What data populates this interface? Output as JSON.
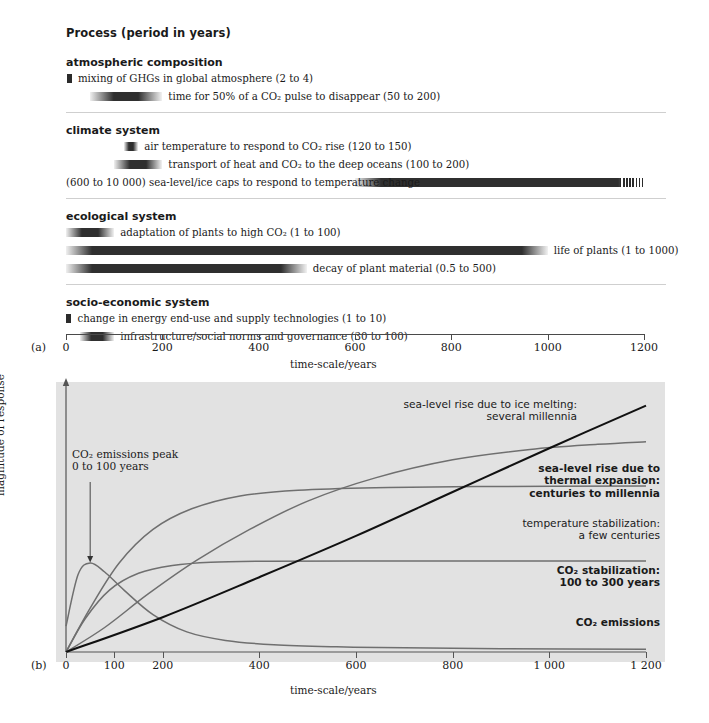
{
  "panel_a": {
    "letter": "(a)",
    "title": "Process (period in years)",
    "axis_label": "time-scale/years",
    "axis_ticks": [
      0,
      200,
      400,
      600,
      800,
      1000,
      1200
    ],
    "axis_tick_labels": [
      "0",
      "200",
      "400",
      "600",
      "800",
      "1000",
      "1200"
    ],
    "axis_min": 0,
    "axis_max": 1200,
    "groups": [
      {
        "heading": "atmospheric composition",
        "rows": [
          {
            "label": "mixing of GHGs in global atmosphere (2 to 4)",
            "range_label": "(2 to 4)",
            "start": 2,
            "end": 4,
            "label_side": "right"
          },
          {
            "label": "time for 50% of a CO₂ pulse to disappear (50 to 200)",
            "range_label": "(50 to 200)",
            "start": 50,
            "end": 200,
            "label_side": "right"
          }
        ]
      },
      {
        "heading": "climate system",
        "rows": [
          {
            "label": "air temperature to respond to CO₂ rise (120 to 150)",
            "range_label": "(120 to 150)",
            "start": 120,
            "end": 150,
            "label_side": "right"
          },
          {
            "label": "transport of heat and CO₂ to the deep oceans (100 to 200)",
            "range_label": "(100 to 200)",
            "start": 100,
            "end": 200,
            "label_side": "right"
          },
          {
            "label": "(600 to 10 000) sea-level/ice caps to respond to temperature change",
            "range_label": "(600 to 10 000)",
            "start": 600,
            "end": 1200,
            "label_side": "left",
            "hatched_tail": true
          }
        ]
      },
      {
        "heading": "ecological system",
        "rows": [
          {
            "label": "adaptation of plants to high CO₂ (1 to 100)",
            "range_label": "(1 to 100)",
            "start": 1,
            "end": 100,
            "label_side": "right"
          },
          {
            "label": "life of plants (1 to 1000)",
            "range_label": "(1 to 1000)",
            "start": 1,
            "end": 1000,
            "label_side": "right"
          },
          {
            "label": "decay of plant material (0.5 to 500)",
            "range_label": "(0.5 to 500)",
            "start": 0.5,
            "end": 500,
            "label_side": "right"
          }
        ]
      },
      {
        "heading": "socio-economic system",
        "rows": [
          {
            "label": "change in energy end-use and supply technologies (1 to 10)",
            "range_label": "(1 to 10)",
            "start": 1,
            "end": 10,
            "label_side": "right"
          },
          {
            "label": "infrastructure/social norms and governance (30 to 100)",
            "range_label": "(30 to 100)",
            "start": 30,
            "end": 100,
            "label_side": "right"
          }
        ]
      }
    ]
  },
  "panel_b": {
    "letter": "(b)",
    "ylabel": "magnitude of response",
    "axis_label": "time-scale/years",
    "axis_ticks": [
      0,
      100,
      200,
      400,
      600,
      800,
      1000,
      1200
    ],
    "axis_tick_labels": [
      "0",
      "100",
      "200",
      "400",
      "600",
      "800",
      "1 000",
      "1 200"
    ],
    "axis_min": 0,
    "axis_max": 1200,
    "annotation_peak": "CO₂ emissions peak\n0 to 100 years",
    "annotation_peak_line1": "CO₂ emissions peak",
    "annotation_peak_line2": "0 to 100 years",
    "curve_labels": [
      {
        "line1": "sea-level rise due to ice melting:",
        "line2": "several millennia",
        "bold": false
      },
      {
        "line1": "sea-level rise due to",
        "line2": "thermal expansion:",
        "line3": "centuries to millennia",
        "bold": true
      },
      {
        "line1": "temperature stabilization:",
        "line2": "a few centuries",
        "bold": false
      },
      {
        "line1": "CO₂ stabilization:",
        "line2": "100 to 300 years",
        "bold": true
      },
      {
        "line1": "CO₂ emissions",
        "bold": true
      }
    ]
  },
  "chart_data": [
    {
      "type": "bar",
      "name": "panel-a-timescale-ranges",
      "title": "Process (period in years)",
      "xlabel": "time-scale/years",
      "ylabel": "",
      "xlim": [
        0,
        1200
      ],
      "grid": false,
      "orientation": "horizontal",
      "categories": [
        "mixing of GHGs in global atmosphere",
        "time for 50% of a CO2 pulse to disappear",
        "air temperature to respond to CO2 rise",
        "transport of heat and CO2 to the deep oceans",
        "sea-level/ice caps to respond to temperature change",
        "adaptation of plants to high CO2",
        "life of plants",
        "decay of plant material",
        "change in energy end-use and supply technologies",
        "infrastructure/social norms and governance"
      ],
      "ranges": [
        [
          2,
          4
        ],
        [
          50,
          200
        ],
        [
          120,
          150
        ],
        [
          100,
          200
        ],
        [
          600,
          10000
        ],
        [
          1,
          100
        ],
        [
          1,
          1000
        ],
        [
          0.5,
          500
        ],
        [
          1,
          10
        ],
        [
          30,
          100
        ]
      ],
      "groups": [
        "atmospheric composition",
        "atmospheric composition",
        "climate system",
        "climate system",
        "climate system",
        "ecological system",
        "ecological system",
        "ecological system",
        "socio-economic system",
        "socio-economic system"
      ]
    },
    {
      "type": "line",
      "name": "panel-b-response-curves",
      "title": "",
      "xlabel": "time-scale/years",
      "ylabel": "magnitude of response",
      "xlim": [
        0,
        1200
      ],
      "ylim": [
        0,
        1
      ],
      "grid": false,
      "legend": "inline-annotations",
      "series": [
        {
          "name": "CO2 emissions",
          "points": [
            [
              0,
              0.1
            ],
            [
              25,
              0.3
            ],
            [
              50,
              0.345
            ],
            [
              80,
              0.31
            ],
            [
              120,
              0.24
            ],
            [
              180,
              0.145
            ],
            [
              250,
              0.078
            ],
            [
              330,
              0.045
            ],
            [
              430,
              0.028
            ],
            [
              560,
              0.02
            ],
            [
              700,
              0.016
            ],
            [
              900,
              0.013
            ],
            [
              1200,
              0.011
            ]
          ]
        },
        {
          "name": "CO2 stabilization: 100 to 300 years",
          "points": [
            [
              0,
              0.0
            ],
            [
              40,
              0.13
            ],
            [
              90,
              0.24
            ],
            [
              150,
              0.305
            ],
            [
              220,
              0.335
            ],
            [
              300,
              0.348
            ],
            [
              420,
              0.352
            ],
            [
              600,
              0.353
            ],
            [
              900,
              0.353
            ],
            [
              1200,
              0.353
            ]
          ]
        },
        {
          "name": "temperature stabilization: a few centuries",
          "points": [
            [
              0,
              0.0
            ],
            [
              50,
              0.17
            ],
            [
              110,
              0.345
            ],
            [
              180,
              0.475
            ],
            [
              260,
              0.555
            ],
            [
              360,
              0.605
            ],
            [
              480,
              0.627
            ],
            [
              640,
              0.637
            ],
            [
              850,
              0.641
            ],
            [
              1200,
              0.643
            ]
          ]
        },
        {
          "name": "sea-level rise due to thermal expansion: centuries to millennia",
          "points": [
            [
              0,
              0.0
            ],
            [
              80,
              0.095
            ],
            [
              170,
              0.225
            ],
            [
              270,
              0.355
            ],
            [
              380,
              0.475
            ],
            [
              500,
              0.585
            ],
            [
              640,
              0.675
            ],
            [
              800,
              0.745
            ],
            [
              960,
              0.785
            ],
            [
              1100,
              0.805
            ],
            [
              1200,
              0.815
            ]
          ]
        },
        {
          "name": "sea-level rise due to ice melting: several millennia",
          "points": [
            [
              0,
              0.0
            ],
            [
              200,
              0.135
            ],
            [
              400,
              0.29
            ],
            [
              600,
              0.45
            ],
            [
              800,
              0.62
            ],
            [
              1000,
              0.79
            ],
            [
              1200,
              0.955
            ]
          ]
        }
      ]
    }
  ]
}
